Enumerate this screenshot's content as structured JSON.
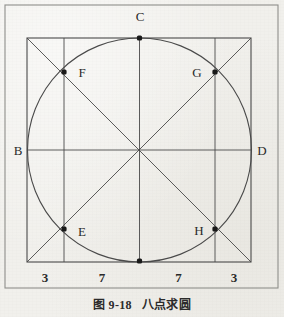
{
  "figure": {
    "caption_number": "图 9-18",
    "caption_title": "八点求圆",
    "frame": {
      "x": 5,
      "y": 5,
      "width": 273,
      "height": 283
    },
    "square": {
      "x": 27,
      "y": 38,
      "size": 224
    },
    "circle": {
      "cx": 139.5,
      "cy": 150,
      "r": 112
    },
    "colors": {
      "background": "#f1f0ec",
      "ink": "#3a3a3a",
      "frame": "#8a8a86",
      "point_fill": "#1a1a1a",
      "text": "#2a2a2a"
    }
  },
  "chart_data": {
    "type": "diagram",
    "title": "八点求圆",
    "subtitle": "图 9-18",
    "square_side": 20,
    "segment_divisions": [
      3,
      7,
      7,
      3
    ],
    "points": [
      {
        "id": "B",
        "label": "B",
        "x": 27,
        "y": 150,
        "marker": false,
        "label_x": 18,
        "label_y": 155,
        "anchor": "middle"
      },
      {
        "id": "C",
        "label": "C",
        "x": 139.5,
        "y": 38,
        "marker": true,
        "label_x": 140,
        "label_y": 21,
        "anchor": "middle"
      },
      {
        "id": "D",
        "label": "D",
        "x": 251,
        "y": 150,
        "marker": false,
        "label_x": 262,
        "label_y": 155,
        "anchor": "middle"
      },
      {
        "id": "A",
        "label": "",
        "x": 139.5,
        "y": 261,
        "marker": true,
        "label_x": 140,
        "label_y": 275,
        "anchor": "middle"
      },
      {
        "id": "F",
        "label": "F",
        "x": 64,
        "y": 72,
        "marker": true,
        "label_x": 82,
        "label_y": 77,
        "anchor": "middle"
      },
      {
        "id": "G",
        "label": "G",
        "x": 215,
        "y": 72,
        "marker": true,
        "label_x": 197,
        "label_y": 77,
        "anchor": "middle"
      },
      {
        "id": "E",
        "label": "E",
        "x": 64,
        "y": 229,
        "marker": true,
        "label_x": 82,
        "label_y": 236,
        "anchor": "middle"
      },
      {
        "id": "H",
        "label": "H",
        "x": 215,
        "y": 229,
        "marker": true,
        "label_x": 199,
        "label_y": 235,
        "anchor": "middle"
      }
    ],
    "dimension_labels": [
      {
        "value": "3",
        "x": 45,
        "y": 282
      },
      {
        "value": "7",
        "x": 102,
        "y": 282
      },
      {
        "value": "7",
        "x": 178.5,
        "y": 282
      },
      {
        "value": "3",
        "x": 234,
        "y": 282
      }
    ],
    "guide_lines": {
      "vertical_left_x": 64,
      "vertical_right_x": 215,
      "vertical_center_x": 139.5,
      "horizontal_center_y": 150
    },
    "axis_on": false,
    "grid": false,
    "legend": "none"
  }
}
